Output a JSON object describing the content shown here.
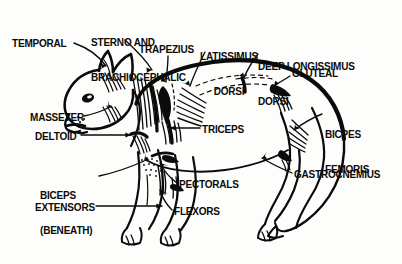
{
  "figure": {
    "style": "black-and-white line drawing",
    "background_color": "#fdfdfb",
    "ink_color": "#0b0b0b",
    "width": 402,
    "height": 264
  },
  "labels": [
    {
      "id": "temporal",
      "text": "TEMPORAL",
      "lines": [
        "TEMPORAL"
      ],
      "x": 12,
      "y": 38,
      "align": "left"
    },
    {
      "id": "sterno-brachio",
      "text": "STERNO AND BRACHIOCEPHALIC",
      "lines": [
        "STERNO AND",
        "BRACHIOCEPHALIC"
      ],
      "x": 91,
      "y": 14,
      "align": "left"
    },
    {
      "id": "trapezius",
      "text": "TRAPEZIUS",
      "lines": [
        "TRAPEZIUS"
      ],
      "x": 139,
      "y": 44,
      "align": "left"
    },
    {
      "id": "latissimus-dorsi",
      "text": "LATISSIMUS DORSI",
      "lines": [
        "LATISSIMUS",
        "DORSI"
      ],
      "x": 196,
      "y": 28,
      "align": "center"
    },
    {
      "id": "deep-longissimus-dorsi",
      "text": "DEEP LONGISSIMUS DORSI",
      "lines": [
        "DEEP LONGISSIMUS",
        "DORSI"
      ],
      "x": 258,
      "y": 38,
      "align": "left"
    },
    {
      "id": "gluteal",
      "text": "GLUTEAL",
      "lines": [
        "GLUTEAL"
      ],
      "x": 292,
      "y": 68,
      "align": "left"
    },
    {
      "id": "bicpes-femoris",
      "text": "BICPES FEMORIS",
      "lines": [
        "BICPES",
        "FEMORIS"
      ],
      "x": 325,
      "y": 106,
      "align": "left"
    },
    {
      "id": "masseter",
      "text": "MASSETER",
      "lines": [
        "MASSETER"
      ],
      "x": 30,
      "y": 112,
      "align": "left"
    },
    {
      "id": "deltoid",
      "text": "DELTOID",
      "lines": [
        "DELTOID"
      ],
      "x": 35,
      "y": 131,
      "align": "left"
    },
    {
      "id": "triceps",
      "text": "TRICEPS",
      "lines": [
        "TRICEPS"
      ],
      "x": 202,
      "y": 124,
      "align": "left"
    },
    {
      "id": "biceps-beneath",
      "text": "BICEPS (BENEATH)",
      "lines": [
        "BICEPS",
        "(BENEATH)"
      ],
      "x": 40,
      "y": 167,
      "align": "left"
    },
    {
      "id": "extensors",
      "text": "EXTENSORS",
      "lines": [
        "EXTENSORS"
      ],
      "x": 35,
      "y": 202,
      "align": "left"
    },
    {
      "id": "pectorals",
      "text": "PECTORALS",
      "lines": [
        "PECTORALS"
      ],
      "x": 179,
      "y": 179,
      "align": "left"
    },
    {
      "id": "flexors",
      "text": "FLEXORS",
      "lines": [
        "FLEXORS"
      ],
      "x": 174,
      "y": 206,
      "align": "left"
    },
    {
      "id": "gastrocnemius",
      "text": "GASTROCNEMIUS",
      "lines": [
        "GASTROCNEMIUS"
      ],
      "x": 294,
      "y": 169,
      "align": "left"
    }
  ]
}
